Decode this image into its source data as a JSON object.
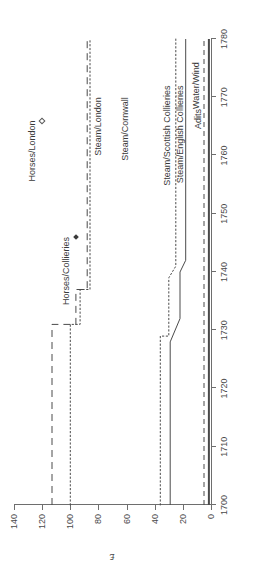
{
  "chart_data": {
    "type": "line",
    "title": "",
    "xlabel": "",
    "ylabel": "£",
    "xlim": [
      1700,
      1780
    ],
    "ylim": [
      0,
      140
    ],
    "grid": false,
    "legend_position": "inline-labels",
    "x_ticks": [
      1700,
      1710,
      1720,
      1730,
      1740,
      1750,
      1760,
      1770,
      1780
    ],
    "x_tick_labels": [
      "1700",
      "1710",
      "1720",
      "1730",
      "1740",
      "1750",
      "1760",
      "1770",
      "1780"
    ],
    "y_ticks": [
      0,
      20,
      40,
      60,
      80,
      100,
      120,
      140
    ],
    "y_tick_labels": [
      "0",
      "20",
      "40",
      "60",
      "80",
      "100",
      "120",
      "140"
    ],
    "series": [
      {
        "name": "Horses/Collieries",
        "style": "dashed",
        "label_x": 1746,
        "label_y": 103,
        "marker": "filled-diamond",
        "marker_x": 1746,
        "marker_y": 96,
        "points": [
          {
            "x": 1700,
            "y": 113
          },
          {
            "x": 1731,
            "y": 113
          },
          {
            "x": 1731,
            "y": 96
          },
          {
            "x": 1737,
            "y": 96
          },
          {
            "x": 1737,
            "y": 88
          },
          {
            "x": 1780,
            "y": 88
          }
        ]
      },
      {
        "name": "Horses/London",
        "style": "marker-only",
        "label_x": 1766,
        "label_y": 126,
        "marker": "hollow-diamond",
        "marker_x": 1766,
        "marker_y": 120,
        "points": []
      },
      {
        "name": "Steam/London",
        "style": "dashed",
        "label_x": 1770,
        "label_y": 80,
        "points": []
      },
      {
        "name": "Steam/Collieries",
        "style": "dotted",
        "label_x": 0,
        "label_y": 0,
        "points": [
          {
            "x": 1700,
            "y": 100
          },
          {
            "x": 1731,
            "y": 100
          },
          {
            "x": 1731,
            "y": 93
          },
          {
            "x": 1737,
            "y": 93
          },
          {
            "x": 1737,
            "y": 86
          },
          {
            "x": 1780,
            "y": 86
          }
        ]
      },
      {
        "name": "Steam/Cornwall",
        "style": "dotted",
        "label_x": 1770,
        "label_y": 61,
        "points": []
      },
      {
        "name": "Steam/Scottish Collieries",
        "style": "dotted",
        "label_x": 1771,
        "label_y": 30,
        "points": [
          {
            "x": 1700,
            "y": 36
          },
          {
            "x": 1729,
            "y": 36
          },
          {
            "x": 1729,
            "y": 30
          },
          {
            "x": 1739,
            "y": 30
          },
          {
            "x": 1741,
            "y": 25
          },
          {
            "x": 1780,
            "y": 25
          }
        ]
      },
      {
        "name": "Steam/English Collieries",
        "style": "solid",
        "label_x": 1771,
        "label_y": 22,
        "points": [
          {
            "x": 1700,
            "y": 29
          },
          {
            "x": 1728,
            "y": 29
          },
          {
            "x": 1732,
            "y": 22
          },
          {
            "x": 1740,
            "y": 22
          },
          {
            "x": 1742,
            "y": 18
          },
          {
            "x": 1780,
            "y": 18
          }
        ]
      },
      {
        "name": "Adits",
        "style": "dashed-short",
        "label_x": 1769,
        "label_y": 9,
        "points": [
          {
            "x": 1700,
            "y": 5
          },
          {
            "x": 1780,
            "y": 5
          }
        ]
      },
      {
        "name": "Water/Wind",
        "style": "solid-thick",
        "label_x": 1776,
        "label_y": 9,
        "points": [
          {
            "x": 1700,
            "y": 1.5
          },
          {
            "x": 1780,
            "y": 1.5
          }
        ]
      }
    ],
    "inline_labels": [
      {
        "text": "Horses/Collieries",
        "x": 1746,
        "y": 103
      },
      {
        "text": "Horses/London",
        "x": 1766,
        "y": 127
      },
      {
        "text": "Steam/London",
        "x": 1770,
        "y": 80
      },
      {
        "text": "Steam/Cornwall",
        "x": 1770,
        "y": 61
      },
      {
        "text": "Steam/Scottish Collieries",
        "x": 1772,
        "y": 31
      },
      {
        "text": "Steam/English Collieries",
        "x": 1772,
        "y": 22
      },
      {
        "text": "Adits",
        "x": 1768,
        "y": 9
      },
      {
        "text": "Water/Wind",
        "x": 1776,
        "y": 11
      }
    ],
    "colors": {
      "axis": "#6e6e6e",
      "text": "#3a3a3a",
      "series": "#4a4a4a"
    }
  }
}
